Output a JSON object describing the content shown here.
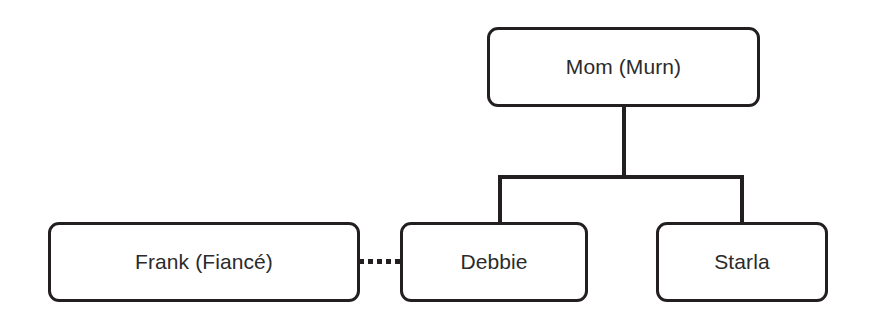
{
  "diagram": {
    "type": "family-tree",
    "background_color": "#ffffff",
    "node_stroke_color": "#231f20",
    "node_fill_color": "#ffffff",
    "text_color": "#2b2b2b",
    "nodes": [
      {
        "id": "mom",
        "label": "Mom (Murn)"
      },
      {
        "id": "frank",
        "label": "Frank (Fiancé)"
      },
      {
        "id": "debbie",
        "label": "Debbie"
      },
      {
        "id": "starla",
        "label": "Starla"
      }
    ],
    "edges": [
      {
        "id": "mom-trunk",
        "from": "mom",
        "to": "sibling-bar",
        "style": "solid"
      },
      {
        "id": "sibling-bar",
        "from": "mom",
        "to": "children",
        "style": "solid"
      },
      {
        "id": "debbie-leg",
        "from": "sibling-bar",
        "to": "debbie",
        "style": "solid"
      },
      {
        "id": "starla-leg",
        "from": "sibling-bar",
        "to": "starla",
        "style": "solid"
      },
      {
        "id": "frank-debbie",
        "from": "frank",
        "to": "debbie",
        "style": "dotted"
      }
    ]
  }
}
